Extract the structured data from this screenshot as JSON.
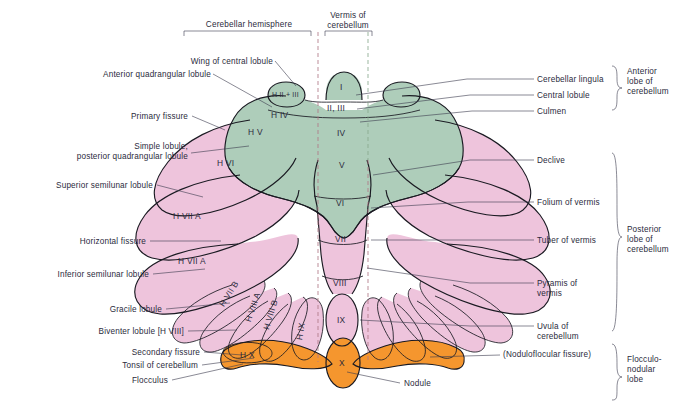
{
  "figure": {
    "colors": {
      "anterior_lobe_green": "#aecdba",
      "posterior_lobe_pink": "#eec4dc",
      "flocculonodular_orange": "#f5962e",
      "outline": "#1a1a22",
      "text": "#2b2b3c",
      "dashed_vermis_line": "#b07a86",
      "background": "#ffffff"
    }
  },
  "top_labels": {
    "hemisphere": "Cerebellar hemisphere",
    "vermis": "Vermis of\ncerebellum"
  },
  "left_labels": [
    {
      "id": "wing-of-central-lobule",
      "text": "Wing of central lobule"
    },
    {
      "id": "anterior-quadrangular-lobule",
      "text": "Anterior quadrangular lobule"
    },
    {
      "id": "primary-fissure",
      "text": "Primary fissure"
    },
    {
      "id": "simple-lobule",
      "text": "Simple lobule,\nposterior quadrangular lobule"
    },
    {
      "id": "superior-semilunar-lobule",
      "text": "Superior semilunar lobule"
    },
    {
      "id": "horizontal-fissure",
      "text": "Horizontal fissure"
    },
    {
      "id": "inferior-semilunar-lobule",
      "text": "Inferior semilunar lobule"
    },
    {
      "id": "gracile-lobule",
      "text": "Gracile lobule"
    },
    {
      "id": "biventer-lobule",
      "text": "Biventer lobule [H VIII]"
    },
    {
      "id": "secondary-fissure",
      "text": "Secondary fissure"
    },
    {
      "id": "tonsil-of-cerebellum",
      "text": "Tonsil of cerebellum"
    },
    {
      "id": "flocculus",
      "text": "Flocculus"
    }
  ],
  "right_labels": [
    {
      "id": "cerebellar-lingula",
      "text": "Cerebellar lingula"
    },
    {
      "id": "central-lobule",
      "text": "Central lobule"
    },
    {
      "id": "culmen",
      "text": "Culmen"
    },
    {
      "id": "declive",
      "text": "Declive"
    },
    {
      "id": "folium-of-vermis",
      "text": "Folium of vermis"
    },
    {
      "id": "tuber-of-vermis",
      "text": "Tuber of vermis"
    },
    {
      "id": "pyramis-of-vermis",
      "text": "Pyramis of\nvermis"
    },
    {
      "id": "uvula-of-cerebellum",
      "text": "Uvula of\ncerebellum"
    },
    {
      "id": "noduloflocular-fissure",
      "text": "(Noduloflocular fissure)"
    },
    {
      "id": "nodule",
      "text": "Nodule"
    }
  ],
  "lobe_brackets": [
    {
      "id": "anterior-lobe",
      "text": "Anterior\nlobe of\ncerebellum"
    },
    {
      "id": "posterior-lobe",
      "text": "Posterior\nlobe of\ncerebellum"
    },
    {
      "id": "flocculonodular-lobe",
      "text": "Flocculo-\nnodular\nlobe"
    }
  ],
  "vermis_segments": [
    {
      "id": "vermis-I",
      "text": "I"
    },
    {
      "id": "vermis-II-III",
      "text": "II, III"
    },
    {
      "id": "vermis-IV",
      "text": "IV"
    },
    {
      "id": "vermis-V",
      "text": "V"
    },
    {
      "id": "vermis-VI",
      "text": "VI"
    },
    {
      "id": "vermis-VII",
      "text": "VII"
    },
    {
      "id": "vermis-VIII",
      "text": "VIII"
    },
    {
      "id": "vermis-IX",
      "text": "IX"
    },
    {
      "id": "vermis-X",
      "text": "X"
    }
  ],
  "hemisphere_segments": [
    {
      "id": "hemi-H-II-III",
      "text": "H II + III"
    },
    {
      "id": "hemi-H-IV",
      "text": "H IV"
    },
    {
      "id": "hemi-H-V",
      "text": "H V"
    },
    {
      "id": "hemi-H-VI",
      "text": "H VI"
    },
    {
      "id": "hemi-H-VIIA-sup",
      "text": "H VII A"
    },
    {
      "id": "hemi-H-VIIA-inf",
      "text": "H VII A"
    },
    {
      "id": "hemi-H-VIIB",
      "text": "H VII B"
    },
    {
      "id": "hemi-H-VIIIA",
      "text": "H VIII A"
    },
    {
      "id": "hemi-H-VIIIB",
      "text": "H VIII B"
    },
    {
      "id": "hemi-H-IX",
      "text": "H IX"
    },
    {
      "id": "hemi-H-X",
      "text": "H X"
    }
  ]
}
